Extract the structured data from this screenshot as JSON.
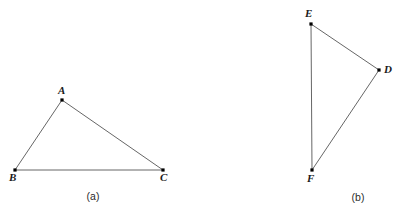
{
  "figure": {
    "background_color": "#ffffff",
    "stroke_color": "#555555",
    "vertex_color": "#000000",
    "label_color": "#1a1a1a",
    "stroke_width": 0.9,
    "vertex_size": 3.2,
    "width": 403,
    "height": 219
  },
  "panels": [
    {
      "id": "panel-a",
      "caption": "(a)",
      "caption_x": 93,
      "caption_y": 191,
      "shape": "triangle",
      "vertices": [
        {
          "name": "A",
          "x": 62,
          "y": 100,
          "label_x": 58,
          "label_y": 85,
          "label_anchor": "above"
        },
        {
          "name": "B",
          "x": 15,
          "y": 170,
          "label_x": 9,
          "label_y": 172,
          "label_anchor": "below-left"
        },
        {
          "name": "C",
          "x": 163,
          "y": 170,
          "label_x": 160,
          "label_y": 172,
          "label_anchor": "below-right"
        }
      ],
      "edges": [
        {
          "name": "AB",
          "from": "A",
          "to": "B"
        },
        {
          "name": "BC",
          "from": "B",
          "to": "C"
        },
        {
          "name": "CA",
          "from": "C",
          "to": "A"
        }
      ]
    },
    {
      "id": "panel-b",
      "caption": "(b)",
      "caption_x": 358,
      "caption_y": 192,
      "shape": "triangle",
      "vertices": [
        {
          "name": "E",
          "x": 311,
          "y": 24,
          "label_x": 305,
          "label_y": 8,
          "label_anchor": "above"
        },
        {
          "name": "D",
          "x": 379,
          "y": 70,
          "label_x": 384,
          "label_y": 64,
          "label_anchor": "right"
        },
        {
          "name": "F",
          "x": 312,
          "y": 170,
          "label_x": 307,
          "label_y": 173,
          "label_anchor": "below"
        }
      ],
      "edges": [
        {
          "name": "ED",
          "from": "E",
          "to": "D"
        },
        {
          "name": "DF",
          "from": "D",
          "to": "F"
        },
        {
          "name": "FE",
          "from": "F",
          "to": "E"
        }
      ]
    }
  ]
}
